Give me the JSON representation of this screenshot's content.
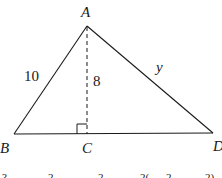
{
  "diagram": {
    "type": "geometry-triangle",
    "points": {
      "A": {
        "label": "A",
        "x": 87,
        "y": 26
      },
      "B": {
        "label": "B",
        "x": 14,
        "y": 134
      },
      "C": {
        "label": "C",
        "x": 87,
        "y": 134
      },
      "D": {
        "label": "D",
        "x": 213,
        "y": 133
      }
    },
    "segments": [
      {
        "from": "A",
        "to": "B",
        "label": "10",
        "style": "solid"
      },
      {
        "from": "A",
        "to": "D",
        "label": "y",
        "style": "solid"
      },
      {
        "from": "B",
        "to": "D",
        "label": "",
        "style": "solid"
      },
      {
        "from": "A",
        "to": "C",
        "label": "8",
        "style": "dashed"
      }
    ],
    "right_angle_at": "C",
    "labels": {
      "A": "A",
      "B": "B",
      "C": "C",
      "D": "D",
      "AB": "10",
      "AC": "8",
      "AD": "y"
    },
    "stroke_color": "#1a1a1a",
    "bottom_text_cropped": "? ... 2 ... 2 ... 2 ( ... 2 ... 2 )"
  }
}
